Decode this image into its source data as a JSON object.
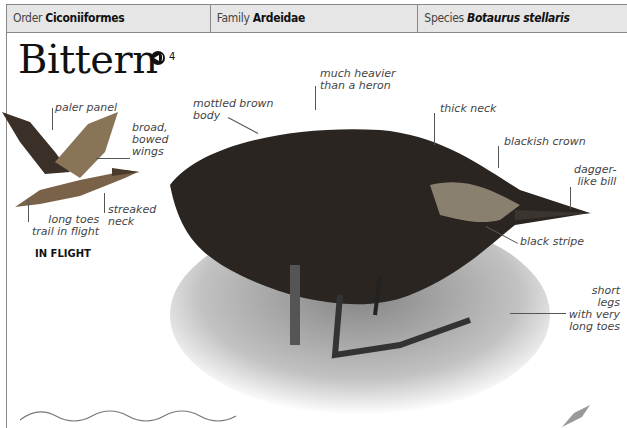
{
  "header": {
    "order_label": "Order",
    "order_value": "Ciconiiformes",
    "family_label": "Family",
    "family_value": "Ardeidae",
    "species_label": "Species",
    "species_value": "Botaurus stellaris"
  },
  "title": "Bittern",
  "sound": {
    "icon": "speaker-icon",
    "track": "4"
  },
  "flight_inset": {
    "caption": "IN FLIGHT",
    "labels": {
      "paler_panel": "paler panel",
      "wings": "broad, bowed wings",
      "wings_l1": "broad,",
      "wings_l2": "bowed",
      "wings_l3": "wings",
      "toes_l1": "long toes",
      "toes_l2": "trail in flight",
      "neck_l1": "streaked",
      "neck_l2": "neck"
    }
  },
  "main_labels": {
    "body_l1": "mottled brown",
    "body_l2": "body",
    "heavier_l1": "much heavier",
    "heavier_l2": "than a heron",
    "thick_neck": "thick neck",
    "crown": "blackish crown",
    "bill_l1": "dagger-",
    "bill_l2": "like bill",
    "stripe": "black stripe",
    "legs_l1": "short legs",
    "legs_l2": "with very",
    "legs_l3": "long toes"
  },
  "colors": {
    "header_bg": "#e6e6e6",
    "rule": "#888888",
    "text": "#111111"
  }
}
